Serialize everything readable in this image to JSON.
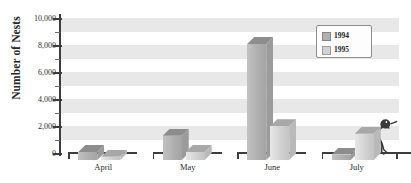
{
  "chart_data": {
    "type": "bar",
    "title": "",
    "subtitle": "",
    "xlabel": "",
    "ylabel": "Number of Nests",
    "categories": [
      "April",
      "May",
      "June",
      "July"
    ],
    "series": [
      {
        "name": "1994",
        "color": "#b0b0b0",
        "values": [
          600,
          1800,
          8600,
          400
        ]
      },
      {
        "name": "1995",
        "color": "#d2d2d2",
        "values": [
          250,
          600,
          2500,
          1950
        ]
      }
    ],
    "ylim": [
      0,
      10000
    ],
    "ytick_values": [
      0,
      2000,
      4000,
      6000,
      8000,
      10000
    ],
    "ytick_labels": [
      "0",
      "2,000",
      "4,000",
      "6,000",
      "8,000",
      "10,000"
    ],
    "minor_tick_interval": 1000,
    "grid": "alternating-horizontal-bands",
    "band_interval": 1000,
    "band_color": "#e8e8e8",
    "legend_position": "top-right",
    "legend_entries": [
      "1994",
      "1995"
    ],
    "style": "3d-extruded-bars"
  },
  "legend": {
    "entries": [
      {
        "label": "1994",
        "color": "#b0b0b0"
      },
      {
        "label": "1995",
        "color": "#d2d2d2"
      }
    ]
  },
  "decoration": {
    "bird_name": "ibis-silhouette"
  }
}
